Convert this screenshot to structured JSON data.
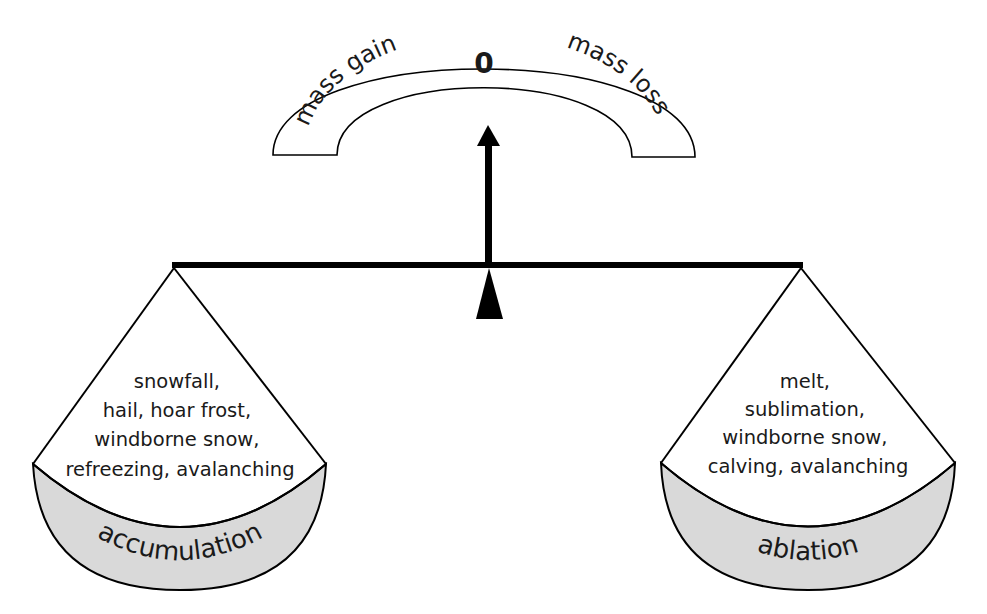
{
  "gauge": {
    "left_label": "mass gain",
    "center_label": "0",
    "right_label": "mass loss"
  },
  "left_pan": {
    "items": [
      "snowfall,",
      "hail, hoar frost,",
      "windborne snow,",
      "refreezing, avalanching"
    ],
    "label": "accumulation"
  },
  "right_pan": {
    "items": [
      "melt,",
      "sublimation,",
      "windborne snow,",
      "calving, avalanching"
    ],
    "label": "ablation"
  },
  "colors": {
    "stroke": "#000000",
    "pan_fill": "#d9d9d9",
    "background": "#ffffff"
  }
}
